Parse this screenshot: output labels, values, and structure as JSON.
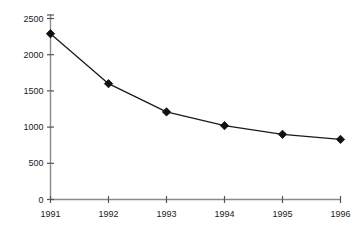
{
  "chart_data": {
    "type": "line",
    "title": "",
    "xlabel": "",
    "ylabel": "",
    "categories": [
      "1991",
      "1992",
      "1993",
      "1994",
      "1995",
      "1996"
    ],
    "values": [
      2290,
      1600,
      1210,
      1020,
      900,
      830
    ],
    "series": [
      {
        "name": "series-1",
        "values": [
          2290,
          1600,
          1210,
          1020,
          900,
          830
        ]
      }
    ],
    "ylim": [
      0,
      2500
    ],
    "yticks": [
      0,
      500,
      1000,
      1500,
      2000,
      2500
    ],
    "ytick_labels": [
      "0",
      "500",
      "1000",
      "1500",
      "2000",
      "2500"
    ],
    "xtick_labels": [
      "1991",
      "1992",
      "1993",
      "1994",
      "1995",
      "1996"
    ],
    "grid": false,
    "legend": null,
    "marker": "diamond",
    "line_color": "#1a1a1a",
    "marker_color": "#111111",
    "axis_color": "#8a8a8a",
    "tick_color": "#555555",
    "label_color": "#1a1a1a",
    "background_color": "#ffffff"
  }
}
